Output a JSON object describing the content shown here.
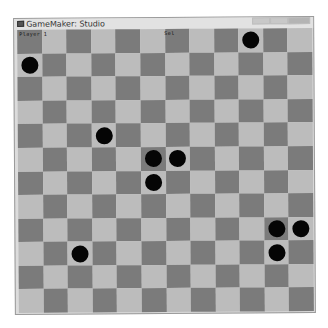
{
  "window": {
    "title": "GameMaker: Studio",
    "buttons": [
      "minimize",
      "maximize",
      "close"
    ]
  },
  "hud": {
    "player_label": "Player 1",
    "status_label": "Sel"
  },
  "board": {
    "rows": 12,
    "cols": 12,
    "colors": {
      "dark": "#7b7b7b",
      "light": "#bcbcbc",
      "piece": "#050505"
    },
    "dark_parity": "even",
    "pieces": [
      {
        "row": 0,
        "col": 9
      },
      {
        "row": 1,
        "col": 0
      },
      {
        "row": 4,
        "col": 3
      },
      {
        "row": 5,
        "col": 5
      },
      {
        "row": 5,
        "col": 6
      },
      {
        "row": 6,
        "col": 5
      },
      {
        "row": 8,
        "col": 10
      },
      {
        "row": 8,
        "col": 11
      },
      {
        "row": 9,
        "col": 10
      },
      {
        "row": 9,
        "col": 2
      }
    ]
  }
}
